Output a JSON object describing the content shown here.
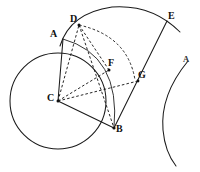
{
  "figure": {
    "kind": "geometry-diagram",
    "background_color": "#ffffff",
    "ink_color": "#1a1a1a",
    "width": 200,
    "height": 172
  },
  "points": [
    {
      "id": "A",
      "label": "A",
      "x": 63,
      "y": 39,
      "label_x": 50,
      "label_y": 29,
      "dot": false
    },
    {
      "id": "D",
      "label": "D",
      "x": 79,
      "y": 25,
      "label_x": 70,
      "label_y": 14,
      "dot": true
    },
    {
      "id": "E",
      "label": "E",
      "x": 167,
      "y": 21,
      "label_x": 168,
      "label_y": 11,
      "dot": false
    },
    {
      "id": "F",
      "label": "F",
      "x": 109,
      "y": 70,
      "label_x": 108,
      "label_y": 58,
      "dot": true
    },
    {
      "id": "G",
      "label": "G",
      "x": 138,
      "y": 81,
      "label_x": 138,
      "label_y": 70,
      "dot": true
    },
    {
      "id": "C",
      "label": "C",
      "x": 58,
      "y": 101,
      "label_x": 47,
      "label_y": 93,
      "dot": true
    },
    {
      "id": "B",
      "label": "B",
      "x": 114,
      "y": 128,
      "label_x": 116,
      "label_y": 124,
      "dot": true
    },
    {
      "id": "A2",
      "label": "A",
      "x": 186,
      "y": 64,
      "label_x": 183,
      "label_y": 55,
      "dot": false
    }
  ],
  "shapes": {
    "main_circle": {
      "name": "circle-centre-C",
      "cx": 58,
      "cy": 101,
      "r": 48,
      "style": "solid"
    },
    "arc_AFB": {
      "name": "arc-A-F-B",
      "path": "M 63 39 Q 121 55 114 128",
      "style": "solid"
    },
    "arc_DE_outer": {
      "name": "arc-D-E-outer",
      "path": "M 60 46 Q 70 13 112 7 Q 152 4 180 32",
      "style": "solid"
    },
    "arc_DG_dashed": {
      "name": "arc-D-G-dashed",
      "path": "M 79 25 Q 128 36 135 80",
      "style": "dashed"
    },
    "arc_right": {
      "name": "arc-right-A",
      "path": "M 188 61 Q 160 95 163 130 Q 165 152 176 166",
      "style": "solid"
    }
  },
  "segments": [
    {
      "name": "segment-A-C",
      "from": "A",
      "to": "C",
      "style": "solid"
    },
    {
      "name": "segment-C-B",
      "from": "C",
      "to": "B",
      "style": "solid"
    },
    {
      "name": "segment-B-E",
      "from": "B",
      "to": "E",
      "style": "solid"
    },
    {
      "name": "segment-C-D",
      "from": "C",
      "to": "D",
      "style": "dashed"
    },
    {
      "name": "segment-C-F",
      "from": "C",
      "to": "F",
      "style": "dashed"
    },
    {
      "name": "segment-C-G",
      "from": "C",
      "to": "G",
      "style": "dashed"
    },
    {
      "name": "segment-D-F",
      "from": "D",
      "to": "F",
      "style": "dashed"
    },
    {
      "name": "segment-D-B",
      "from": "D",
      "to": "B",
      "style": "dashed"
    }
  ]
}
